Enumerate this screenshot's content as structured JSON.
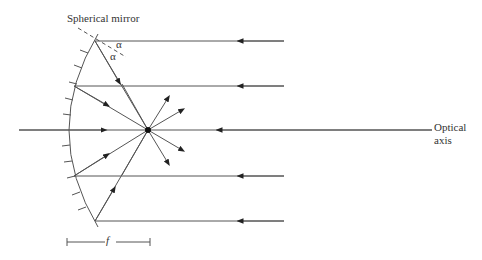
{
  "figure": {
    "title_label": "Spherical mirror",
    "axis_label_line1": "Optical",
    "axis_label_line2": "axis",
    "angle_label_1": "α",
    "angle_label_2": "α",
    "focal_length_label": "f"
  },
  "geometry": {
    "mirror_vertex": [
      68,
      130
    ],
    "focal_point": [
      148,
      130
    ],
    "rays_y": [
      41,
      86,
      130,
      176,
      221
    ],
    "ray_right_end_x": 284,
    "axis_right_end_x": 432,
    "axis_left_start_x": 19,
    "focal_bar": {
      "x1": 67,
      "x2": 150,
      "y": 242
    }
  },
  "colors": {
    "line": "#555555",
    "text": "#333333"
  }
}
